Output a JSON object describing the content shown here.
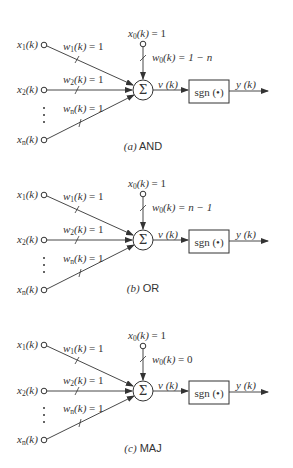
{
  "figure": {
    "panels": [
      {
        "id": "a",
        "caption_letter": "(a)",
        "caption_name": "AND",
        "inputs": [
          {
            "var": "x",
            "sub": "1",
            "arg": "(k)"
          },
          {
            "var": "x",
            "sub": "2",
            "arg": "(k)"
          },
          {
            "var": "x",
            "sub": "n",
            "arg": "(k)"
          }
        ],
        "weights": [
          {
            "var": "w",
            "sub": "1",
            "arg": "(k)",
            "value": " = 1"
          },
          {
            "var": "w",
            "sub": "2",
            "arg": "(k)",
            "value": " = 1"
          },
          {
            "var": "w",
            "sub": "n",
            "arg": "(k)",
            "value": " = 1"
          }
        ],
        "bias_input": {
          "var": "x",
          "sub": "0",
          "arg": "(k)",
          "value": " = 1"
        },
        "bias_weight": {
          "var": "w",
          "sub": "0",
          "arg": "(k)",
          "value": " = 1 − n"
        },
        "sum_symbol": "Σ",
        "induced_field": "v (k)",
        "activation": "sgn (•)",
        "output": "y (k)"
      },
      {
        "id": "b",
        "caption_letter": "(b)",
        "caption_name": "OR",
        "inputs": [
          {
            "var": "x",
            "sub": "1",
            "arg": "(k)"
          },
          {
            "var": "x",
            "sub": "2",
            "arg": "(k)"
          },
          {
            "var": "x",
            "sub": "n",
            "arg": "(k)"
          }
        ],
        "weights": [
          {
            "var": "w",
            "sub": "1",
            "arg": "(k)",
            "value": " = 1"
          },
          {
            "var": "w",
            "sub": "2",
            "arg": "(k)",
            "value": " = 1"
          },
          {
            "var": "w",
            "sub": "n",
            "arg": "(k)",
            "value": " = 1"
          }
        ],
        "bias_input": {
          "var": "x",
          "sub": "0",
          "arg": "(k)",
          "value": " = 1"
        },
        "bias_weight": {
          "var": "w",
          "sub": "0",
          "arg": "(k)",
          "value": " = n − 1"
        },
        "sum_symbol": "Σ",
        "induced_field": "v (k)",
        "activation": "sgn (•)",
        "output": "y (k)"
      },
      {
        "id": "c",
        "caption_letter": "(c)",
        "caption_name": "MAJ",
        "inputs": [
          {
            "var": "x",
            "sub": "1",
            "arg": "(k)"
          },
          {
            "var": "x",
            "sub": "2",
            "arg": "(k)"
          },
          {
            "var": "x",
            "sub": "n",
            "arg": "(k)"
          }
        ],
        "weights": [
          {
            "var": "w",
            "sub": "1",
            "arg": "(k)",
            "value": " = 1"
          },
          {
            "var": "w",
            "sub": "2",
            "arg": "(k)",
            "value": " = 1"
          },
          {
            "var": "w",
            "sub": "n",
            "arg": "(k)",
            "value": " = 1"
          }
        ],
        "bias_input": {
          "var": "x",
          "sub": "0",
          "arg": "(k)",
          "value": " = 1"
        },
        "bias_weight": {
          "var": "w",
          "sub": "0",
          "arg": "(k)",
          "value": " = 0"
        },
        "sum_symbol": "Σ",
        "induced_field": "v (k)",
        "activation": "sgn (•)",
        "output": "y (k)"
      }
    ],
    "colors": {
      "stroke": "#333333",
      "background": "#ffffff"
    }
  }
}
